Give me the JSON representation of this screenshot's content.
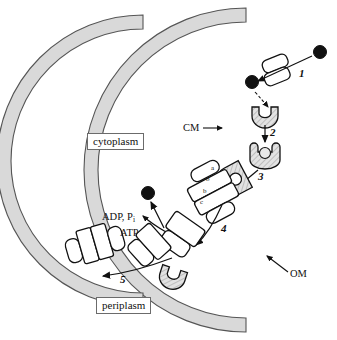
{
  "figure": {
    "compartments": {
      "cytoplasm": "cytoplasm",
      "periplasm": "periplasm"
    },
    "membranes": [
      {
        "id": "om",
        "label": "OM",
        "full_name": "outer membrane",
        "color": "#d9d9d9",
        "stroke": "#555555"
      },
      {
        "id": "cm",
        "label": "CM",
        "full_name": "cytoplasmic membrane",
        "color": "#d9d9d9",
        "stroke": "#555555"
      }
    ],
    "steps": [
      {
        "number": "1",
        "description": "substrate crosses the outer membrane through a porin"
      },
      {
        "number": "2",
        "description": "substrate binds the periplasmic binding protein"
      },
      {
        "number": "3",
        "description": "loaded binding protein docks onto the ABC transporter"
      },
      {
        "number": "4",
        "description": "substrate translocated into the cytoplasm"
      },
      {
        "number": "5",
        "description": "transporter recycles"
      }
    ],
    "transporter_subunits": [
      "a",
      "b",
      "b",
      "c"
    ],
    "energetics": {
      "products": "ADP, P",
      "products_subscript": "i",
      "substrate": "ATP"
    },
    "substrate_marker": {
      "name": "substrate",
      "color": "#111111"
    },
    "binding_protein": {
      "name": "periplasmic binding protein",
      "fill": "#d0d0d0"
    }
  }
}
